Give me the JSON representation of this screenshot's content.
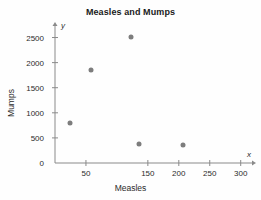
{
  "chart_data": {
    "type": "scatter",
    "title": "Measles and Mumps",
    "xlabel": "Measles",
    "ylabel": "Mumps",
    "x_axis_letter": "x",
    "y_axis_letter": "y",
    "grid": false,
    "legend": null,
    "xlim": [
      0,
      315
    ],
    "ylim": [
      0,
      2650
    ],
    "xticks": [
      50,
      150,
      200,
      250,
      300
    ],
    "xtick_labels": [
      "50",
      "150",
      "200",
      "250",
      "300"
    ],
    "yticks": [
      0,
      500,
      1000,
      1500,
      2000,
      2500
    ],
    "ytick_labels": [
      "0",
      "500",
      "1000",
      "1500",
      "2000",
      "2500"
    ],
    "marker_color": "#7d7d7d",
    "axis_color": "#8a8a8a",
    "points": [
      {
        "x": 25,
        "y": 800
      },
      {
        "x": 58,
        "y": 1850
      },
      {
        "x": 122,
        "y": 2520
      },
      {
        "x": 135,
        "y": 380
      },
      {
        "x": 207,
        "y": 350
      }
    ]
  }
}
